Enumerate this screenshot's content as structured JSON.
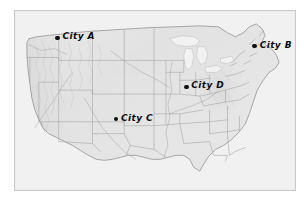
{
  "figure": {
    "type": "shaded-relief-map",
    "region": "Contiguous United States",
    "frame_color": "#c9c9c9",
    "background_color": "#ffffff",
    "land_color": "#e4e4e4",
    "water_color": "#f4f4f4",
    "border_line_color": "#9a9a9a",
    "marker_color": "#101010"
  },
  "cities": [
    {
      "id": "city-a",
      "label": "City A",
      "x_pct": 15.2,
      "y_pct": 15.0
    },
    {
      "id": "city-b",
      "label": "City B",
      "x_pct": 85.6,
      "y_pct": 19.6
    },
    {
      "id": "city-c",
      "label": "City C",
      "x_pct": 36.1,
      "y_pct": 60.5
    },
    {
      "id": "city-d",
      "label": "City D",
      "x_pct": 61.2,
      "y_pct": 42.3
    }
  ]
}
